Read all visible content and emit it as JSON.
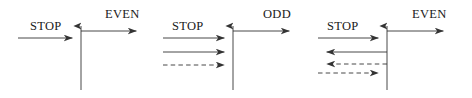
{
  "figure": {
    "background_color": "#ffffff",
    "line_color": "#333333",
    "text_color": "#1a1a1a",
    "width": 472,
    "height": 98
  },
  "panels": [
    {
      "id": "panel-1",
      "axis_x": 81,
      "axis_top_y": 18,
      "axis_bottom_y": 90,
      "labels": [
        {
          "name": "stop-label",
          "text": "STOP",
          "x": 30,
          "y": 20
        },
        {
          "name": "even-label",
          "text": "EVEN",
          "x": 105,
          "y": 8
        }
      ],
      "arrows": [
        {
          "name": "stop-incoming-arrow",
          "direction": "right",
          "style": "solid",
          "x1": 18,
          "x2": 81,
          "y": 38
        },
        {
          "name": "even-outgoing-arrow",
          "direction": "right",
          "style": "solid",
          "x1": 81,
          "x2": 145,
          "y": 31
        }
      ]
    },
    {
      "id": "panel-2",
      "axis_x": 233,
      "axis_top_y": 18,
      "axis_bottom_y": 90,
      "labels": [
        {
          "name": "stop-label",
          "text": "STOP",
          "x": 172,
          "y": 20
        },
        {
          "name": "odd-label",
          "text": "ODD",
          "x": 263,
          "y": 8
        }
      ],
      "arrows": [
        {
          "name": "stop-incoming-arrow",
          "direction": "right",
          "style": "solid",
          "x1": 163,
          "x2": 233,
          "y": 38
        },
        {
          "name": "odd-outgoing-arrow",
          "direction": "right",
          "style": "solid",
          "x1": 233,
          "x2": 298,
          "y": 31
        },
        {
          "name": "second-incoming-arrow",
          "direction": "right",
          "style": "solid",
          "x1": 163,
          "x2": 233,
          "y": 52
        },
        {
          "name": "third-incoming-dashed-arrow",
          "direction": "right",
          "style": "dashed",
          "x1": 163,
          "x2": 233,
          "y": 65
        }
      ]
    },
    {
      "id": "panel-3",
      "axis_x": 387,
      "axis_top_y": 18,
      "axis_bottom_y": 90,
      "labels": [
        {
          "name": "stop-label",
          "text": "STOP",
          "x": 327,
          "y": 20
        },
        {
          "name": "even-label",
          "text": "EVEN",
          "x": 412,
          "y": 8
        }
      ],
      "arrows": [
        {
          "name": "stop-incoming-arrow",
          "direction": "right",
          "style": "solid",
          "x1": 318,
          "x2": 387,
          "y": 38
        },
        {
          "name": "even-outgoing-arrow",
          "direction": "right",
          "style": "solid",
          "x1": 387,
          "x2": 452,
          "y": 31
        },
        {
          "name": "second-outgoing-arrow",
          "direction": "left",
          "style": "solid",
          "x1": 387,
          "x2": 318,
          "y": 52
        },
        {
          "name": "third-outgoing-dashed-arrow",
          "direction": "left",
          "style": "dashed",
          "x1": 387,
          "x2": 318,
          "y": 64
        },
        {
          "name": "fourth-incoming-dashed-arrow",
          "direction": "right",
          "style": "dashed",
          "x1": 318,
          "x2": 387,
          "y": 73
        }
      ]
    }
  ]
}
